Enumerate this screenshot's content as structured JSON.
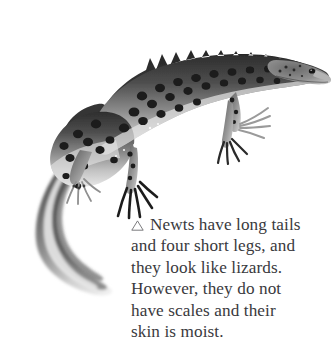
{
  "page": {
    "background_color": "#ffffff",
    "width": 336,
    "height": 360
  },
  "illustration": {
    "name": "newt-photograph",
    "subject": "newt",
    "description": "Black and white photograph of a crested newt seen from the side, head at upper right, body arching down to the left, long tapering tail curving toward the lower left, four short legs with long splayed toes.",
    "palette": {
      "body_dark": "#3a3a3a",
      "body_mid": "#7d7d7d",
      "body_light": "#c9c9c9",
      "spot": "#1c1c1c",
      "belly": "#e4e4e4"
    }
  },
  "caption": {
    "marker_icon": "triangle-up-outline-icon",
    "text_color": "#39393d",
    "lines": [
      "Newts have long tails",
      "and four short legs, and",
      "they look like lizards.",
      "However, they do not",
      "have scales and their",
      "skin is moist."
    ],
    "full_text": "△ Newts have long tails and four short legs, and they look like lizards. However, they do not have scales and their skin is moist."
  }
}
